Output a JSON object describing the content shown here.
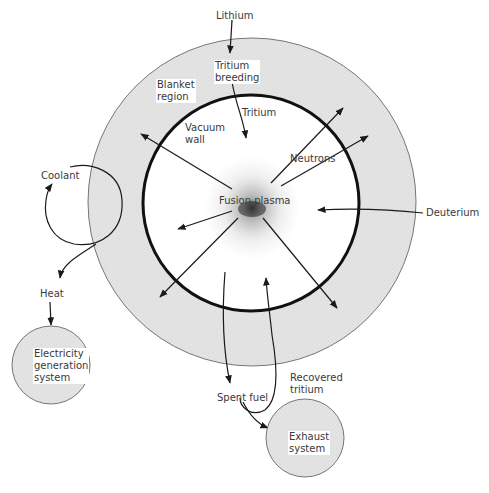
{
  "diagram": {
    "colors": {
      "blanket_fill": "#e6e6e6",
      "exhaust_fill": "#e6e6e6",
      "electricity_fill": "#e6e6e6",
      "line": "#1a1a1a",
      "label": "#3a3a3a",
      "plasma": "#333333"
    },
    "labels": {
      "lithium": "Lithium",
      "tritium_breeding": "Tritium\nbreeding",
      "blanket_region": "Blanket\nregion",
      "tritium": "Tritium",
      "vacuum_wall": "Vacuum\nwall",
      "neutrons": "Neutrons",
      "fusion_plasma": "Fusion plasma",
      "deuterium": "Deuterium",
      "coolant": "Coolant",
      "heat": "Heat",
      "electricity_generation_system": "Electricity\ngeneration\nsystem",
      "recovered_tritium": "Recovered\ntritium",
      "spent_fuel": "Spent fuel",
      "exhaust_system": "Exhaust\nsystem"
    },
    "nodes": [
      {
        "id": "blanket",
        "shape": "circle",
        "cx": 252,
        "cy": 202,
        "r": 164
      },
      {
        "id": "vacuum_wall",
        "shape": "circle",
        "cx": 251,
        "cy": 203,
        "r": 108
      },
      {
        "id": "plasma",
        "shape": "cloud",
        "cx": 252,
        "cy": 208
      },
      {
        "id": "electricity",
        "shape": "circle",
        "cx": 51,
        "cy": 365,
        "r": 39
      },
      {
        "id": "exhaust",
        "shape": "circle",
        "cx": 305,
        "cy": 438,
        "r": 39
      }
    ],
    "edges": [
      {
        "from": "Lithium",
        "to": "Tritium breeding"
      },
      {
        "from": "Tritium breeding",
        "to": "plasma",
        "label": "Tritium"
      },
      {
        "from": "plasma",
        "to": "blanket",
        "label": "Neutrons",
        "count": 6
      },
      {
        "from": "Deuterium",
        "to": "plasma"
      },
      {
        "from": "blanket",
        "to": "Coolant loop"
      },
      {
        "from": "Coolant loop",
        "to": "Electricity generation system",
        "label": "Heat"
      },
      {
        "from": "plasma",
        "to": "Exhaust system",
        "label": "Spent fuel"
      },
      {
        "from": "Exhaust system",
        "to": "plasma",
        "label": "Recovered tritium"
      }
    ]
  }
}
